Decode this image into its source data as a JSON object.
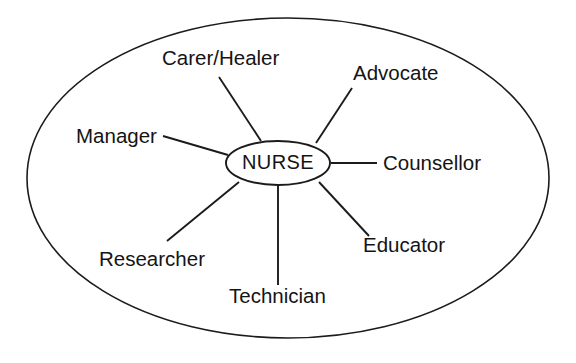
{
  "diagram": {
    "type": "radial-spoke",
    "colors": {
      "stroke": "#1b1b1b",
      "text": "#141414",
      "background": "#ffffff"
    },
    "boundary": {
      "label": "outer boundary ellipse",
      "cx": 288,
      "cy": 178,
      "rx": 261,
      "ry": 160
    },
    "core": {
      "label": "NURSE",
      "cx": 278,
      "cy": 163,
      "rx": 52,
      "ry": 22
    },
    "roles": [
      {
        "id": "carer-healer",
        "label": "Carer/Healer",
        "text_x": 162,
        "text_y": 65,
        "anchor": "start",
        "line_x1": 219,
        "line_y1": 77,
        "line_x2": 261,
        "line_y2": 141
      },
      {
        "id": "advocate",
        "label": "Advocate",
        "text_x": 353,
        "text_y": 80,
        "anchor": "start",
        "line_x1": 352,
        "line_y1": 88,
        "line_x2": 316,
        "line_y2": 143
      },
      {
        "id": "counsellor",
        "label": "Counsellor",
        "text_x": 383,
        "text_y": 170,
        "anchor": "start",
        "line_x1": 331,
        "line_y1": 163,
        "line_x2": 377,
        "line_y2": 163
      },
      {
        "id": "educator",
        "label": "Educator",
        "text_x": 363,
        "text_y": 252,
        "anchor": "start",
        "line_x1": 319,
        "line_y1": 182,
        "line_x2": 369,
        "line_y2": 236
      },
      {
        "id": "technician",
        "label": "Technician",
        "text_x": 229,
        "text_y": 303,
        "anchor": "start",
        "line_x1": 278,
        "line_y1": 186,
        "line_x2": 278,
        "line_y2": 285
      },
      {
        "id": "researcher",
        "label": "Researcher",
        "text_x": 99,
        "text_y": 266,
        "anchor": "start",
        "line_x1": 239,
        "line_y1": 182,
        "line_x2": 167,
        "line_y2": 241
      },
      {
        "id": "manager",
        "label": "Manager",
        "text_x": 76,
        "text_y": 143,
        "anchor": "start",
        "line_x1": 163,
        "line_y1": 136,
        "line_x2": 228,
        "line_y2": 155
      }
    ]
  }
}
